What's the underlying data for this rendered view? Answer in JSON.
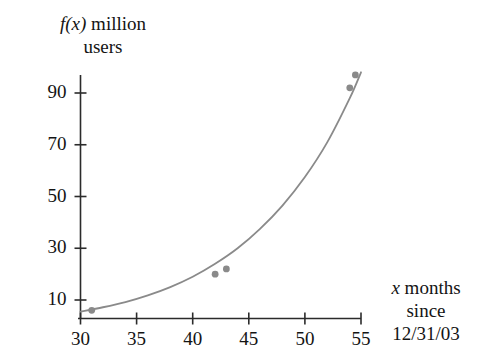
{
  "chart_data": {
    "type": "line",
    "title": "",
    "ylabel": "f(x) million users",
    "ylabel_lines": [
      "f(x) million",
      "users"
    ],
    "xlabel": "x months since 12/31/03",
    "xlabel_lines": [
      "x months",
      "since",
      "12/31/03"
    ],
    "xlabel_italic_var": "x",
    "ylabel_italic_var": "f(x)",
    "xlim": [
      30,
      55
    ],
    "ylim": [
      0,
      100
    ],
    "xticks": [
      30,
      35,
      40,
      45,
      50,
      55
    ],
    "xtick_labels": [
      "30",
      "35",
      "40",
      "45",
      "50",
      "55"
    ],
    "yticks": [
      10,
      30,
      50,
      70,
      90
    ],
    "ytick_labels": [
      "10",
      "30",
      "50",
      "70",
      "90"
    ],
    "grid": false,
    "legend": null,
    "series": [
      {
        "name": "f(x) million users",
        "color": "#8a8a8a",
        "curve_x": [
          30,
          32,
          34,
          36,
          38,
          40,
          42,
          44,
          46,
          48,
          50,
          52,
          54,
          55
        ],
        "curve_y": [
          5.5,
          7.2,
          9.2,
          11.8,
          15.0,
          19.0,
          24.0,
          30.0,
          37.5,
          46.5,
          57.5,
          71.0,
          88.0,
          98.0
        ],
        "points": [
          {
            "x": 31,
            "y": 6
          },
          {
            "x": 42,
            "y": 20
          },
          {
            "x": 43,
            "y": 22
          },
          {
            "x": 54,
            "y": 92
          },
          {
            "x": 54.5,
            "y": 97
          }
        ]
      }
    ],
    "axis_color": "#2b2b2b",
    "curve_color": "#8a8a8a",
    "marker_color": "#8a8a8a"
  }
}
